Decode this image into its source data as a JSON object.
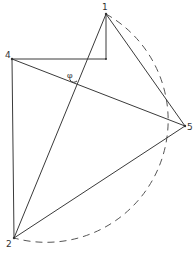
{
  "diagram": {
    "points": [
      {
        "id": "1",
        "label": "1",
        "x": 106,
        "y": 14
      },
      {
        "id": "2",
        "label": "2",
        "x": 14,
        "y": 238
      },
      {
        "id": "4",
        "label": "4",
        "x": 12,
        "y": 59
      },
      {
        "id": "5",
        "label": "5",
        "x": 185,
        "y": 126
      },
      {
        "id": "corner",
        "label": "",
        "x": 106,
        "y": 59
      }
    ],
    "angle_label": "φ",
    "edges": [
      [
        "1",
        "2"
      ],
      [
        "1",
        "5"
      ],
      [
        "2",
        "5"
      ],
      [
        "4",
        "2"
      ],
      [
        "4",
        "5"
      ],
      [
        "4",
        "corner"
      ],
      [
        "corner",
        "1"
      ]
    ],
    "arc": {
      "style": "dashed",
      "from": "1",
      "through": "5",
      "to": "2"
    }
  }
}
